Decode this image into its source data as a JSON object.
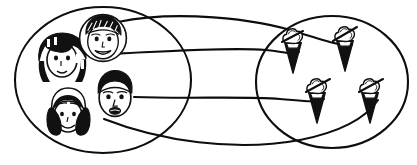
{
  "figure": {
    "style": "black-and-white hand-drawn line art",
    "background_color": "#ffffff",
    "stroke_color": "#0d0d0d",
    "fill_dark": "#111111",
    "fill_light": "#ffffff",
    "canvas": {
      "width": 417,
      "height": 165
    }
  },
  "left_set": {
    "name": "children-set",
    "label": "Children",
    "shape": "ellipse",
    "center": {
      "x": 103,
      "y": 80
    },
    "radius": {
      "x": 88,
      "y": 73
    },
    "member_count": 4,
    "members": [
      {
        "id": "child-1",
        "label": "Girl with black bobbed hair and bangs",
        "icon": "child-face-icon",
        "center": {
          "x": 62,
          "y": 57
        },
        "hair": "black-bob",
        "skin": "light"
      },
      {
        "id": "child-2",
        "label": "Boy with short scribbled hair",
        "icon": "child-face-icon",
        "center": {
          "x": 103,
          "y": 38
        },
        "hair": "short-textured",
        "skin": "light"
      },
      {
        "id": "child-3",
        "label": "Girl with black pigtails",
        "icon": "child-face-icon",
        "center": {
          "x": 68,
          "y": 111
        },
        "hair": "pigtails",
        "skin": "light"
      },
      {
        "id": "child-4",
        "label": "Boy with dark short hair",
        "icon": "child-face-icon",
        "center": {
          "x": 115,
          "y": 94
        },
        "hair": "short-dark",
        "skin": "dark"
      }
    ]
  },
  "right_set": {
    "name": "cones-set",
    "label": "Ice cream cones",
    "shape": "ellipse",
    "center": {
      "x": 332,
      "y": 82
    },
    "radius": {
      "x": 76,
      "y": 66
    },
    "member_count": 4,
    "members": [
      {
        "id": "cone-1",
        "label": "Ice cream cone",
        "icon": "ice-cream-cone-icon",
        "center": {
          "x": 293,
          "y": 50
        }
      },
      {
        "id": "cone-2",
        "label": "Ice cream cone",
        "icon": "ice-cream-cone-icon",
        "center": {
          "x": 345,
          "y": 48
        }
      },
      {
        "id": "cone-3",
        "label": "Ice cream cone",
        "icon": "ice-cream-cone-icon",
        "center": {
          "x": 317,
          "y": 100
        }
      },
      {
        "id": "cone-4",
        "label": "Ice cream cone",
        "icon": "ice-cream-cone-icon",
        "center": {
          "x": 370,
          "y": 100
        }
      }
    ]
  },
  "mapping": {
    "type": "one-to-one-correspondence",
    "edge_count": 4,
    "edges": [
      {
        "id": "edge-1",
        "from": "child-2",
        "to": "cone-2",
        "path": "M 118 22 C 175 10 255 18 300 33 C 330 42 345 47 352 45"
      },
      {
        "id": "edge-2",
        "from": "child-1",
        "to": "cone-1",
        "path": "M 90 55 C 150 52 230 47 266 50 C 285 52 292 55 299 52"
      },
      {
        "id": "edge-3",
        "from": "child-4",
        "to": "cone-3",
        "path": "M 134 97 C 190 99 245 96 280 99 C 305 101 315 103 324 99"
      },
      {
        "id": "edge-4",
        "from": "child-3",
        "to": "cone-4",
        "path": "M 104 119 C 160 141 235 152 300 140 C 345 131 368 115 378 100"
      }
    ]
  },
  "accessibility": {
    "description": "A left oval holds four children's faces. A right oval holds four ice cream cones. Four curved lines pair each child with exactly one cone."
  }
}
